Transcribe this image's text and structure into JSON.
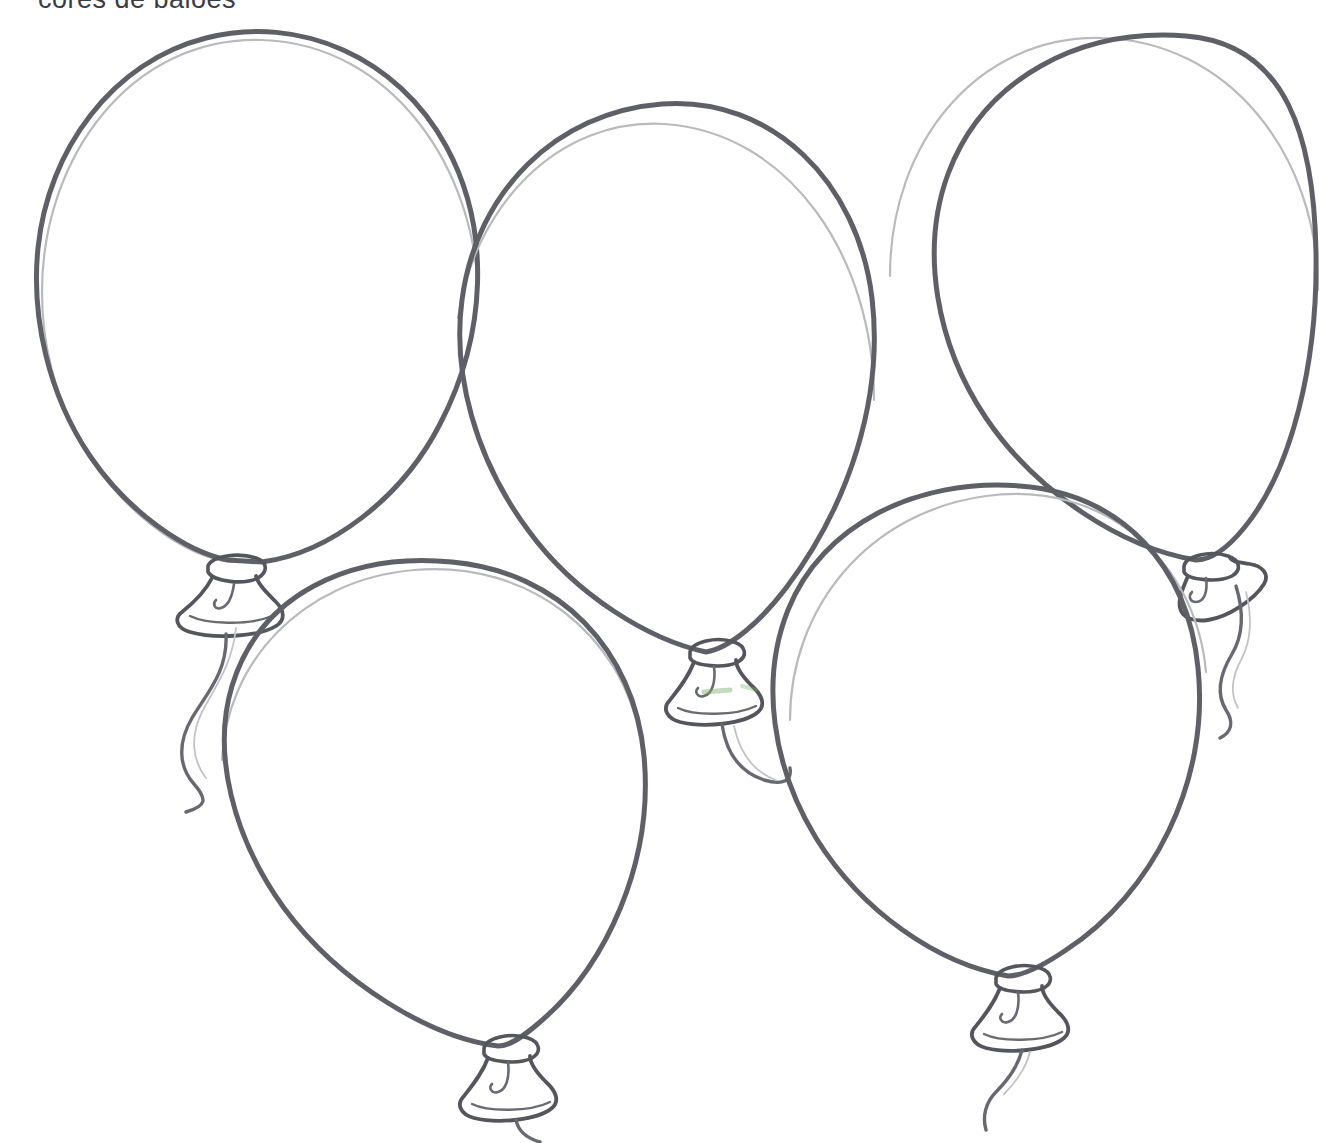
{
  "page": {
    "title_text": "cores de balões",
    "background_color": "#ffffff",
    "width": 1326,
    "height": 1143,
    "title_color": "#3c3c46",
    "style": "hand-drawn pencil line-art coloring page"
  },
  "ink": {
    "outline_color": "#5f6066",
    "outline_soft_color": "#8e9095",
    "outline_faint_color": "#b9babd",
    "knot_color": "#55565c",
    "string_color": "#68696f",
    "smudge_green": "#7fae6a"
  },
  "balloons": [
    {
      "id": "balloon-1",
      "label": "Balloon 1 (top left)",
      "position": "top-left",
      "body_center": [
        265,
        285
      ],
      "body_width": 440,
      "body_height": 520,
      "knot_at": [
        228,
        560
      ],
      "has_string": true,
      "string_style": "long wavy S-curve",
      "outline_weight": 5
    },
    {
      "id": "balloon-2",
      "label": "Balloon 2 (top middle)",
      "position": "top-middle",
      "body_center": [
        660,
        370
      ],
      "body_width": 420,
      "body_height": 530,
      "knot_at": [
        712,
        655
      ],
      "has_string": true,
      "string_style": "short hooked curl",
      "outline_weight": 5
    },
    {
      "id": "balloon-3",
      "label": "Balloon 3 (top right)",
      "position": "top-right",
      "body_center": [
        1105,
        280
      ],
      "body_width": 430,
      "body_height": 500,
      "knot_at": [
        1208,
        565
      ],
      "has_string": true,
      "string_style": "long wavy S-curve",
      "outline_weight": 5
    },
    {
      "id": "balloon-4",
      "label": "Balloon 4 (bottom left)",
      "position": "bottom-left",
      "body_center": [
        430,
        790
      ],
      "body_width": 420,
      "body_height": 490,
      "knot_at": [
        505,
        1060
      ],
      "has_string": true,
      "string_style": "short tail curl",
      "outline_weight": 5
    },
    {
      "id": "balloon-5",
      "label": "Balloon 5 (bottom right)",
      "position": "bottom-right",
      "body_center": [
        1000,
        745
      ],
      "body_width": 420,
      "body_height": 510,
      "knot_at": [
        1015,
        990
      ],
      "has_string": true,
      "string_style": "short tail curl",
      "outline_weight": 5
    }
  ],
  "annotations": {
    "green_smudge_note": "faint green pencil smudge inside balloon 2 knot",
    "title_clipped_note": "title text is cropped by the top edge of the page"
  }
}
